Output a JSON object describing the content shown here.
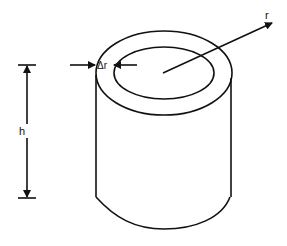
{
  "diagram": {
    "labels": {
      "radius": "r",
      "thickness": "Δr",
      "height": "h"
    },
    "colors": {
      "stroke": "#111111",
      "background": "#ffffff"
    }
  }
}
